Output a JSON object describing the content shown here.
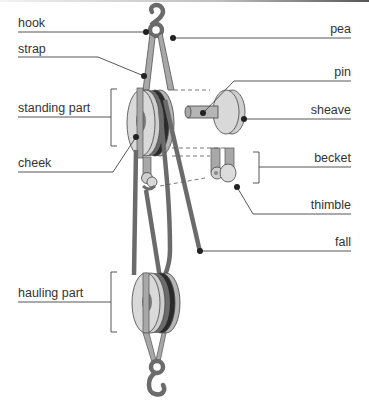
{
  "diagram": {
    "labels_left": [
      {
        "id": "hook",
        "text": "hook"
      },
      {
        "id": "strap",
        "text": "strap"
      },
      {
        "id": "standing_part",
        "text": "standing part"
      },
      {
        "id": "cheek",
        "text": "cheek"
      },
      {
        "id": "hauling_part",
        "text": "hauling part"
      }
    ],
    "labels_right": [
      {
        "id": "pea",
        "text": "pea"
      },
      {
        "id": "pin",
        "text": "pin"
      },
      {
        "id": "sheave",
        "text": "sheave"
      },
      {
        "id": "becket",
        "text": "becket"
      },
      {
        "id": "thimble",
        "text": "thimble"
      },
      {
        "id": "fall",
        "text": "fall"
      }
    ],
    "colors": {
      "rope": "#6b6b6b",
      "sheave_face": "#d9d9d9",
      "sheave_groove": "#2b2b2b",
      "strap": "#a8a8a8",
      "hub": "#7a7a7a",
      "leader_line": "#444444",
      "dot": "#222222"
    }
  }
}
